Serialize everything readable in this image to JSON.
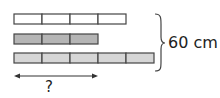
{
  "diagram": {
    "bars": [
      {
        "name": "bar-top",
        "segments": 4,
        "fill": "#ffffff"
      },
      {
        "name": "bar-middle",
        "segments": 3,
        "fill": "#b5b5b5"
      },
      {
        "name": "bar-bottom",
        "segments": 5,
        "fill": "#d6d6d6"
      }
    ],
    "segment_width": 28,
    "stroke": "#444444",
    "total_label": "60 cm",
    "question_label": "?"
  }
}
